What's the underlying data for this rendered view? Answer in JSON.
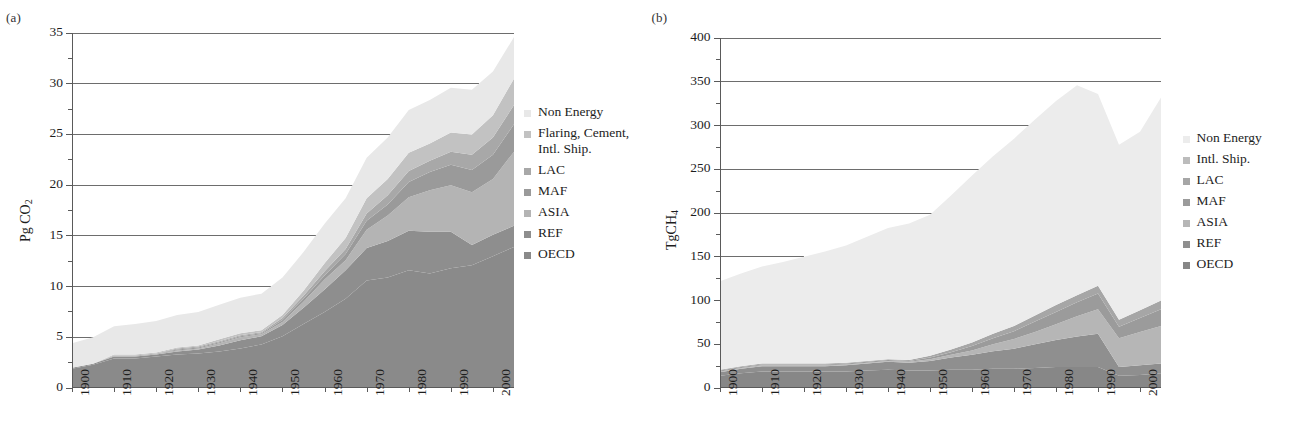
{
  "figure": {
    "panels": [
      {
        "tag": "(a)",
        "ylabel_main": "Pg CO",
        "ylabel_sub": "2",
        "legend": [
          {
            "label": "Non Energy",
            "color": "#e8e8e8"
          },
          {
            "label": "Flaring, Cement,\nIntl. Ship.",
            "color": "#c2c2c2"
          },
          {
            "label": "LAC",
            "color": "#a8a8a8"
          },
          {
            "label": "MAF",
            "color": "#9a9a9a"
          },
          {
            "label": "ASIA",
            "color": "#b4b4b4"
          },
          {
            "label": "REF",
            "color": "#8e8e8e"
          },
          {
            "label": "OECD",
            "color": "#8a8a8a"
          }
        ]
      },
      {
        "tag": "(b)",
        "ylabel_main": "TgCH",
        "ylabel_sub": "4",
        "legend": [
          {
            "label": "Non Energy",
            "color": "#ececec"
          },
          {
            "label": "Intl. Ship.",
            "color": "#bcbcbc"
          },
          {
            "label": "LAC",
            "color": "#a6a6a6"
          },
          {
            "label": "MAF",
            "color": "#9b9b9b"
          },
          {
            "label": "ASIA",
            "color": "#b6b6b6"
          },
          {
            "label": "REF",
            "color": "#8f8f8f"
          },
          {
            "label": "OECD",
            "color": "#878787"
          }
        ]
      }
    ]
  },
  "chart_data": [
    {
      "type": "area",
      "stacked": true,
      "title": "(a)",
      "xlabel": "",
      "ylabel": "Pg CO2",
      "xlim": [
        1900,
        2005
      ],
      "ylim": [
        0,
        35
      ],
      "ytick_step": 5,
      "ytick_minor_step": 2.5,
      "grid": true,
      "grid_axis": "y",
      "legend_position": "right",
      "xticks": [
        1900,
        1910,
        1920,
        1930,
        1940,
        1950,
        1960,
        1970,
        1980,
        1990,
        2000
      ],
      "yticks": [
        0,
        5,
        10,
        15,
        20,
        25,
        30,
        35
      ],
      "x": [
        1900,
        1905,
        1910,
        1915,
        1920,
        1925,
        1930,
        1935,
        1940,
        1945,
        1950,
        1955,
        1960,
        1965,
        1970,
        1975,
        1980,
        1985,
        1990,
        1995,
        2000,
        2005
      ],
      "series": [
        {
          "name": "OECD",
          "color": "#8a8a8a",
          "values": [
            1.9,
            2.3,
            2.9,
            2.9,
            3.1,
            3.3,
            3.4,
            3.6,
            3.9,
            4.3,
            5.1,
            6.3,
            7.5,
            8.8,
            10.6,
            10.9,
            11.6,
            11.3,
            11.8,
            12.1,
            13.0,
            13.9
          ]
        },
        {
          "name": "REF",
          "color": "#8e8e8e",
          "values": [
            0.1,
            0.1,
            0.2,
            0.2,
            0.2,
            0.3,
            0.4,
            0.6,
            0.8,
            0.8,
            1.1,
            1.6,
            2.2,
            2.8,
            3.2,
            3.6,
            3.9,
            4.1,
            3.6,
            2.0,
            2.1,
            2.1
          ]
        },
        {
          "name": "ASIA",
          "color": "#b4b4b4",
          "values": [
            0.0,
            0.0,
            0.1,
            0.1,
            0.1,
            0.1,
            0.1,
            0.2,
            0.3,
            0.2,
            0.3,
            0.6,
            1.0,
            1.0,
            1.8,
            2.5,
            3.3,
            4.1,
            4.6,
            5.2,
            5.5,
            7.3
          ]
        },
        {
          "name": "MAF",
          "color": "#9a9a9a",
          "values": [
            0.0,
            0.0,
            0.0,
            0.0,
            0.0,
            0.1,
            0.1,
            0.1,
            0.1,
            0.1,
            0.2,
            0.3,
            0.4,
            0.6,
            0.9,
            1.1,
            1.5,
            1.8,
            2.0,
            2.2,
            2.4,
            2.7
          ]
        },
        {
          "name": "LAC",
          "color": "#a8a8a8",
          "values": [
            0.0,
            0.0,
            0.0,
            0.0,
            0.0,
            0.1,
            0.1,
            0.1,
            0.1,
            0.1,
            0.2,
            0.3,
            0.4,
            0.5,
            0.7,
            0.9,
            1.1,
            1.1,
            1.3,
            1.5,
            1.7,
            1.9
          ]
        },
        {
          "name": "Flaring, Cement, Intl. Ship.",
          "color": "#c2c2c2",
          "values": [
            0.0,
            0.0,
            0.1,
            0.1,
            0.1,
            0.1,
            0.1,
            0.2,
            0.2,
            0.2,
            0.3,
            0.5,
            0.8,
            1.1,
            1.5,
            1.6,
            1.8,
            1.7,
            1.9,
            2.0,
            2.2,
            2.6
          ]
        },
        {
          "name": "Non Energy",
          "color": "#e8e8e8",
          "values": [
            2.4,
            2.6,
            2.8,
            3.0,
            3.1,
            3.2,
            3.3,
            3.4,
            3.5,
            3.6,
            3.7,
            3.8,
            3.9,
            3.9,
            4.0,
            4.1,
            4.2,
            4.3,
            4.4,
            4.4,
            4.3,
            4.1
          ]
        }
      ]
    },
    {
      "type": "area",
      "stacked": true,
      "title": "(b)",
      "xlabel": "",
      "ylabel": "TgCH4",
      "xlim": [
        1900,
        2005
      ],
      "ylim": [
        0,
        400
      ],
      "ytick_step": 50,
      "ytick_minor_step": 25,
      "grid": true,
      "grid_axis": "y",
      "legend_position": "right",
      "xticks": [
        1900,
        1910,
        1920,
        1930,
        1940,
        1950,
        1960,
        1970,
        1980,
        1990,
        2000
      ],
      "yticks": [
        0,
        50,
        100,
        150,
        200,
        250,
        300,
        350,
        400
      ],
      "x": [
        1900,
        1905,
        1910,
        1915,
        1920,
        1925,
        1930,
        1935,
        1940,
        1945,
        1950,
        1955,
        1960,
        1965,
        1970,
        1975,
        1980,
        1985,
        1990,
        1995,
        2000,
        2005
      ],
      "series": [
        {
          "name": "OECD",
          "color": "#878787",
          "values": [
            14,
            17,
            19,
            19,
            19,
            19,
            19,
            20,
            21,
            20,
            20,
            21,
            21,
            22,
            22,
            23,
            24,
            24,
            24,
            14,
            15,
            17
          ]
        },
        {
          "name": "REF",
          "color": "#8f8f8f",
          "values": [
            4,
            5,
            6,
            6,
            6,
            6,
            7,
            8,
            9,
            9,
            11,
            14,
            17,
            20,
            23,
            27,
            31,
            35,
            38,
            10,
            11,
            11
          ]
        },
        {
          "name": "ASIA",
          "color": "#b6b6b6",
          "values": [
            1,
            1,
            1,
            1,
            1,
            1,
            1,
            1,
            1,
            1,
            2,
            3,
            5,
            8,
            11,
            14,
            18,
            23,
            28,
            33,
            38,
            43
          ]
        },
        {
          "name": "MAF",
          "color": "#9b9b9b",
          "values": [
            1,
            1,
            1,
            1,
            1,
            1,
            1,
            1,
            1,
            1,
            2,
            3,
            5,
            7,
            9,
            12,
            14,
            16,
            18,
            13,
            16,
            19
          ]
        },
        {
          "name": "LAC",
          "color": "#a6a6a6",
          "values": [
            1,
            1,
            1,
            1,
            1,
            1,
            1,
            1,
            1,
            1,
            2,
            3,
            4,
            5,
            6,
            7,
            8,
            8,
            9,
            8,
            9,
            10
          ]
        },
        {
          "name": "Intl. Ship.",
          "color": "#bcbcbc",
          "values": [
            0,
            0,
            0,
            0,
            0,
            0,
            0,
            0,
            0,
            0,
            0,
            0,
            0,
            0,
            0,
            0,
            0,
            0,
            0,
            0,
            0,
            0
          ]
        },
        {
          "name": "Non Energy",
          "color": "#ececec",
          "values": [
            101,
            106,
            111,
            116,
            122,
            128,
            134,
            142,
            150,
            156,
            161,
            176,
            191,
            203,
            214,
            224,
            233,
            240,
            219,
            200,
            204,
            232
          ]
        }
      ]
    }
  ]
}
